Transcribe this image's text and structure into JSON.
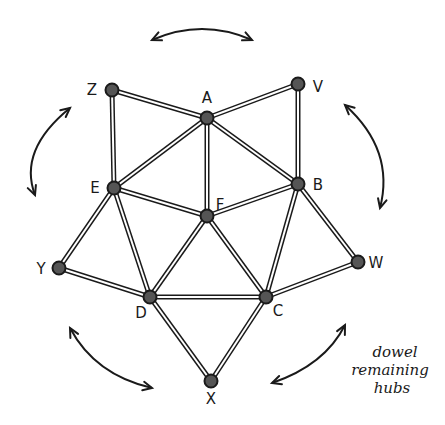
{
  "diagram": {
    "title": "",
    "note_lines": [
      "dowel",
      "remaining",
      "hubs"
    ],
    "colors": {
      "stroke": "#1a1a1a",
      "hub_fill": "#555555",
      "background": "#ffffff"
    },
    "hubs": [
      {
        "id": "Z",
        "label": "Z"
      },
      {
        "id": "A",
        "label": "A"
      },
      {
        "id": "V",
        "label": "V"
      },
      {
        "id": "E",
        "label": "E"
      },
      {
        "id": "F",
        "label": "F"
      },
      {
        "id": "B",
        "label": "B"
      },
      {
        "id": "Y",
        "label": "Y"
      },
      {
        "id": "W",
        "label": "W"
      },
      {
        "id": "D",
        "label": "D"
      },
      {
        "id": "C",
        "label": "C"
      },
      {
        "id": "X",
        "label": "X"
      }
    ],
    "dowels": [
      [
        "Z",
        "A"
      ],
      [
        "A",
        "V"
      ],
      [
        "Z",
        "E"
      ],
      [
        "V",
        "B"
      ],
      [
        "A",
        "E"
      ],
      [
        "A",
        "F"
      ],
      [
        "A",
        "B"
      ],
      [
        "E",
        "F"
      ],
      [
        "F",
        "B"
      ],
      [
        "E",
        "Y"
      ],
      [
        "E",
        "D"
      ],
      [
        "Y",
        "D"
      ],
      [
        "F",
        "D"
      ],
      [
        "F",
        "C"
      ],
      [
        "B",
        "C"
      ],
      [
        "B",
        "W"
      ],
      [
        "W",
        "C"
      ],
      [
        "D",
        "C"
      ],
      [
        "D",
        "X"
      ],
      [
        "C",
        "X"
      ]
    ],
    "rotation_arrows": [
      "top",
      "left",
      "right",
      "bottom-left",
      "bottom-right"
    ]
  }
}
